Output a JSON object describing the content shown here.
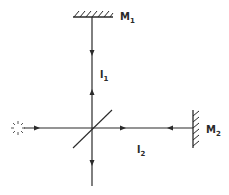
{
  "diagram": {
    "type": "Michelson interferometer",
    "colors": {
      "line": "#2a2a2a",
      "background": "#ffffff"
    },
    "components": {
      "source": {
        "label": "",
        "icon": "light-source-starburst"
      },
      "beam_splitter": {
        "label": ""
      },
      "mirror_1": {
        "label": "M",
        "subscript": "1"
      },
      "mirror_2": {
        "label": "M",
        "subscript": "2"
      }
    },
    "arm_labels": {
      "arm_1": {
        "label": "l",
        "subscript": "1"
      },
      "arm_2": {
        "label": "l",
        "subscript": "2"
      }
    }
  }
}
